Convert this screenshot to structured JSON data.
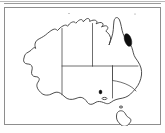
{
  "figure": {
    "type": "map",
    "region": "Australia",
    "style": "line-drawing outline map with internal state boundaries",
    "title": "",
    "caption": "",
    "frame": {
      "visible": true,
      "border_color": "#8d8d8d",
      "background_color": "#ffffff",
      "x": 4,
      "y": 7,
      "width": 157,
      "height": 118
    },
    "top_rule": {
      "visible": true,
      "color": "#b9b9b9"
    }
  },
  "map": {
    "outline_color": "#3a3a3a",
    "fill_color": "#ffffff",
    "boundary_color": "#4a4a4a",
    "mainland_name": "Australian mainland",
    "island_name": "Tasmania",
    "states": [
      {
        "code": "WA",
        "name": "Western Australia"
      },
      {
        "code": "NT",
        "name": "Northern Territory"
      },
      {
        "code": "SA",
        "name": "South Australia"
      },
      {
        "code": "QLD",
        "name": "Queensland"
      },
      {
        "code": "NSW",
        "name": "New South Wales"
      },
      {
        "code": "VIC",
        "name": "Victoria"
      },
      {
        "code": "TAS",
        "name": "Tasmania"
      }
    ]
  },
  "markers": [
    {
      "id": "shaded-area-1",
      "name": "filled distribution area",
      "shape": "elongated blob",
      "color": "#0d0d0d",
      "location_description": "north-east coastal Queensland",
      "x": 119,
      "y": 25,
      "width": 8,
      "height": 14
    },
    {
      "id": "shaded-area-2",
      "name": "small filled mark",
      "shape": "dot",
      "color": "#0d0d0d",
      "location_description": "south-east South Australia / Victoria border coast",
      "x": 94,
      "y": 82,
      "width": 3,
      "height": 4
    }
  ],
  "legend": {
    "visible": false,
    "entries": []
  },
  "labels": {
    "visible": false,
    "items": []
  },
  "scale_bar": {
    "visible": false,
    "text": ""
  },
  "north_arrow": {
    "visible": false,
    "text": ""
  },
  "accessibility": {
    "alt_text": "Outline map of Australia showing state boundaries, with a solid black shaded area on the north-east Queensland coast and a small black mark near the south-east coast."
  }
}
